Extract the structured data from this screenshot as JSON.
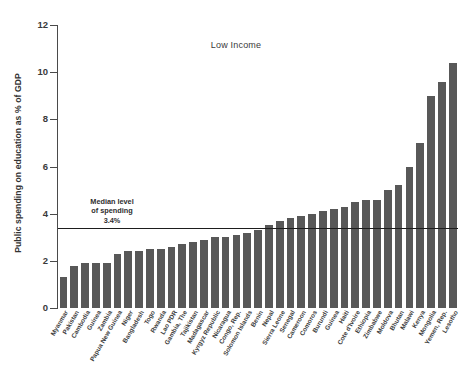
{
  "chart_data": {
    "type": "bar",
    "title": "Low Income",
    "xlabel": "",
    "ylabel": "Public spending on education as % of GDP",
    "ylim": [
      0,
      12
    ],
    "yticks": [
      0,
      2,
      4,
      6,
      8,
      10,
      12
    ],
    "ytick_labels": [
      "0",
      "2",
      "4",
      "6",
      "8",
      "10",
      "12"
    ],
    "grid": false,
    "legend": null,
    "bar_color": "#585858",
    "categories": [
      "Myanmar",
      "Pakistan",
      "Cambodia",
      "Guinea",
      "Zambia",
      "Papua New Guinea",
      "Niger",
      "Bangladesh",
      "Togo",
      "Rwanda",
      "Lao PDR",
      "Gambia, The",
      "Tajikistan",
      "Madagascar",
      "Kyrgyz Republic",
      "Nicaragua",
      "Congo, Rep.",
      "Solomon Islands",
      "Benin",
      "Nepal",
      "Sierra Leone",
      "Senegal",
      "Cameroon",
      "Comoros",
      "Burundi",
      "Guinea",
      "Haiti",
      "Cote d'Ivoire",
      "Ethiopia",
      "Zimbabwe",
      "Moldova",
      "Bhutan",
      "Malawi",
      "Kenya",
      "Mongolia",
      "Yemen, Rep.",
      "Lesotho"
    ],
    "values": [
      1.3,
      1.8,
      1.9,
      1.9,
      1.9,
      2.3,
      2.4,
      2.4,
      2.5,
      2.5,
      2.6,
      2.7,
      2.8,
      2.9,
      3.0,
      3.0,
      3.1,
      3.2,
      3.3,
      3.5,
      3.7,
      3.8,
      3.9,
      4.0,
      4.1,
      4.2,
      4.3,
      4.5,
      4.6,
      4.6,
      5.0,
      5.2,
      6.0,
      7.0,
      9.0,
      9.6,
      10.4
    ],
    "annotations": {
      "median_line_value": 3.4,
      "median_note_line1": "Median level",
      "median_note_line2": "of spending",
      "median_note_line3": "3.4%"
    }
  }
}
